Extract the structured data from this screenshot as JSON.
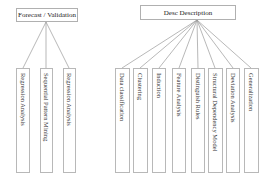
{
  "left_group": {
    "title": "Forecast / Validation",
    "children": [
      "Regression Analysis",
      "Sequential Pattern Mining",
      "Regression Analysis"
    ]
  },
  "right_group": {
    "title": "Desc Description",
    "children": [
      "Data classification",
      "Clustering",
      "Induction",
      "Feature Analysis",
      "Distinguish Rules",
      "Structural Dependency Model",
      "Deviation Analysis",
      "Generalization"
    ]
  },
  "colors": {
    "line": "#9a9a9a",
    "border": "#b0b0b0"
  }
}
